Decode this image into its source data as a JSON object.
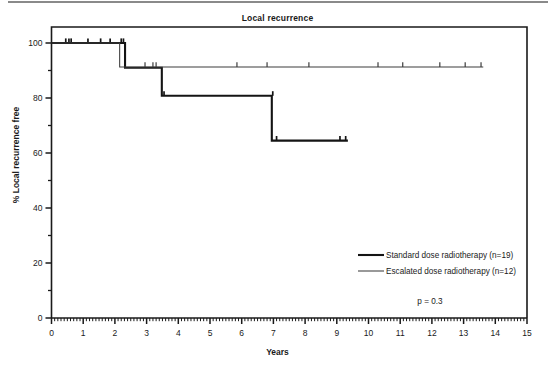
{
  "figure": {
    "title": "Local recurrence",
    "xlabel": "Years",
    "ylabel": "% Local recurrence free",
    "pvalue": "p = 0.3"
  },
  "legend": {
    "items": [
      {
        "label": "Standard dose radiotherapy (n=19)",
        "color": "#1a1a1a",
        "width": 2.1
      },
      {
        "label": "Escalated dose radiotherapy (n=12)",
        "color": "#3a3a3a",
        "width": 1.0
      }
    ]
  },
  "axes": {
    "x_ticks": [
      "0",
      "1",
      "2",
      "3",
      "4",
      "5",
      "6",
      "7",
      "8",
      "9",
      "10",
      "11",
      "12",
      "13",
      "14",
      "15"
    ],
    "y_ticks": [
      "0",
      "20",
      "40",
      "60",
      "80",
      "100"
    ],
    "y_minor": [
      10,
      30,
      50,
      70,
      90
    ],
    "xlim": [
      0,
      15
    ],
    "ylim": [
      0,
      100
    ]
  },
  "chart_data": {
    "type": "line",
    "title": "Local recurrence",
    "xlabel": "Years",
    "ylabel": "% Local recurrence free",
    "xlim": [
      0,
      15
    ],
    "ylim": [
      0,
      100
    ],
    "grid": false,
    "legend_position": "inside-lower-right",
    "annotations": [
      "p = 0.3"
    ],
    "series": [
      {
        "name": "Standard dose radiotherapy (n=19)",
        "n": 19,
        "style": "thick-step",
        "steps": [
          {
            "x": 0.0,
            "y": 100.0
          },
          {
            "x": 2.32,
            "y": 100.0
          },
          {
            "x": 2.32,
            "y": 91.0
          },
          {
            "x": 3.48,
            "y": 91.0
          },
          {
            "x": 3.48,
            "y": 80.8
          },
          {
            "x": 6.95,
            "y": 80.8
          },
          {
            "x": 6.95,
            "y": 64.5
          },
          {
            "x": 9.35,
            "y": 64.5
          }
        ],
        "censor_marks": [
          {
            "x": 0.45,
            "y": 100.0
          },
          {
            "x": 0.55,
            "y": 100.0
          },
          {
            "x": 0.62,
            "y": 100.0
          },
          {
            "x": 1.15,
            "y": 100.0
          },
          {
            "x": 1.55,
            "y": 100.0
          },
          {
            "x": 1.85,
            "y": 100.0
          },
          {
            "x": 2.2,
            "y": 100.0
          },
          {
            "x": 2.27,
            "y": 100.0
          },
          {
            "x": 3.55,
            "y": 80.8
          },
          {
            "x": 6.98,
            "y": 80.8
          },
          {
            "x": 7.1,
            "y": 64.5
          },
          {
            "x": 9.1,
            "y": 64.5
          },
          {
            "x": 9.28,
            "y": 64.5
          }
        ]
      },
      {
        "name": "Escalated dose radiotherapy (n=12)",
        "n": 12,
        "style": "thin-step",
        "steps": [
          {
            "x": 0.0,
            "y": 100.0
          },
          {
            "x": 2.15,
            "y": 100.0
          },
          {
            "x": 2.15,
            "y": 91.3
          },
          {
            "x": 13.62,
            "y": 91.3
          }
        ],
        "censor_marks": [
          {
            "x": 2.95,
            "y": 91.3
          },
          {
            "x": 3.2,
            "y": 91.3
          },
          {
            "x": 3.3,
            "y": 91.3
          },
          {
            "x": 5.85,
            "y": 91.3
          },
          {
            "x": 6.8,
            "y": 91.3
          },
          {
            "x": 8.12,
            "y": 91.3
          },
          {
            "x": 10.3,
            "y": 91.3
          },
          {
            "x": 11.08,
            "y": 91.3
          },
          {
            "x": 12.25,
            "y": 91.3
          },
          {
            "x": 13.05,
            "y": 91.3
          },
          {
            "x": 13.55,
            "y": 91.3
          }
        ]
      }
    ]
  }
}
